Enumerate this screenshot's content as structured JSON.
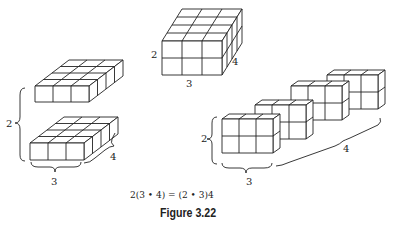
{
  "figure": {
    "caption": "Figure 3.22",
    "equation": "2(3 • 4) = (2 • 3)4",
    "left_model": {
      "height_label": "2",
      "width_label": "3",
      "depth_label": "4",
      "layers": 2,
      "cols": 3,
      "depth": 4
    },
    "center_model": {
      "height_label": "2",
      "width_label": "3",
      "depth_label": "4",
      "rows": 2,
      "cols": 3,
      "depth": 4
    },
    "right_model": {
      "height_label": "2",
      "width_label": "3",
      "depth_label": "4",
      "slices": 4,
      "rows": 2,
      "cols": 3
    },
    "colors": {
      "line": "#222222",
      "background": "#ffffff"
    }
  }
}
